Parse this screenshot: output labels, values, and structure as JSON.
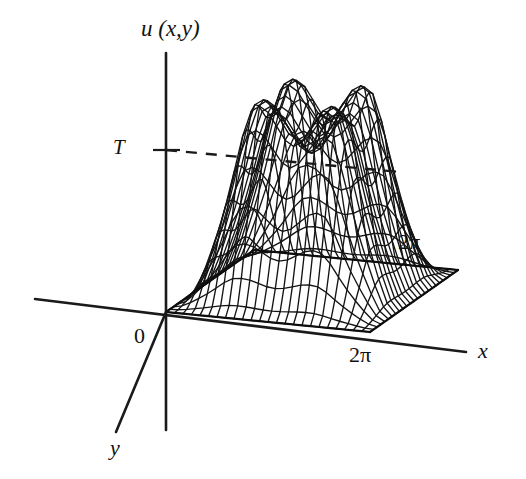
{
  "figure": {
    "title": "",
    "background_color": "#ffffff",
    "ink_color": "#141414",
    "type": "3d-surface-wireframe-diagram"
  },
  "labels": {
    "vertical_axis": "u (x,y)",
    "level_marker": "T",
    "origin": "0",
    "x_axis": "x",
    "y_axis": "y",
    "x_extent": "2π",
    "y_extent": "2π"
  },
  "axes": {
    "vertical": {
      "name": "u (x,y)",
      "from": [
        166,
        53
      ],
      "to": [
        166,
        430
      ]
    },
    "horizontal": {
      "name": "x",
      "from": [
        35,
        299
      ],
      "to": [
        466,
        352
      ]
    },
    "depth": {
      "name": "y",
      "from": [
        166,
        312
      ],
      "to": [
        116,
        432
      ]
    }
  },
  "level_line": {
    "label": "T",
    "tick_y": 150,
    "dashed_from": [
      166,
      150
    ],
    "dashed_to": [
      400,
      172
    ],
    "style": "dashed"
  },
  "chart_data": {
    "type": "surface",
    "title": "",
    "xlabel": "x",
    "ylabel": "y",
    "zlabel": "u (x,y)",
    "xlim": [
      0,
      6.2832
    ],
    "ylim": [
      0,
      6.2832
    ],
    "zlim": [
      0,
      1.0
    ],
    "x_tick_labels": [
      "0",
      "2π"
    ],
    "y_tick_labels": [
      "0",
      "2π"
    ],
    "z_tick_labels": [
      "T"
    ],
    "z_level_T": 1.0,
    "grid": true,
    "legend": null,
    "mesh_divisions_x": 24,
    "mesh_divisions_y": 24,
    "surface_formula": "u(x,y) = T * s(x) * s(y) * (1 + 0.10*cos(3x) + 0.06*cos(3y))",
    "ridge_peaks_u": [
      1.0,
      0.97,
      0.99
    ],
    "ridge_valleys_u": [
      0.86,
      0.85
    ]
  }
}
